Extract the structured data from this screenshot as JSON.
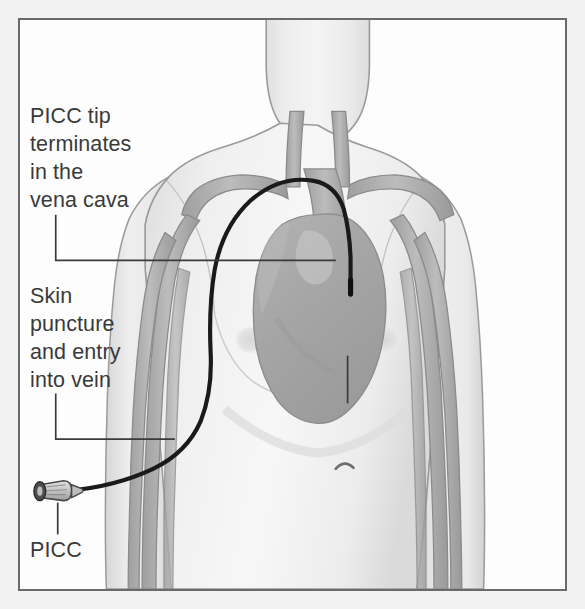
{
  "figure": {
    "type": "medical-illustration",
    "frame": {
      "border_color": "#6a6a6a",
      "background_color": "#fdfdfd",
      "outer_margin_color": "#f2f2f2"
    },
    "palette": {
      "text": "#3a3a3a",
      "leader_line": "#3a3a3a",
      "catheter": "#1a1a1a",
      "body_fill": "#ececec",
      "body_outline": "#9a9a9a",
      "vein_fill": "#b0b0b0",
      "vein_outline": "#8a8a8a",
      "heart_fill": "#a9a9a9",
      "heart_outline": "#8d8d8d",
      "hub_fill": "#c9c9c9",
      "hub_outline": "#4a4a4a"
    }
  },
  "callouts": [
    {
      "id": "picc-tip",
      "text": "PICC tip\nterminates\nin the\nvena cava",
      "leader": "elbow-right",
      "points_to": "superior vena cava"
    },
    {
      "id": "skin-puncture",
      "text": "Skin\npuncture\nand entry\ninto vein",
      "leader": "elbow-right",
      "points_to": "upper arm vein entry site"
    },
    {
      "id": "picc-device",
      "text": "PICC",
      "leader": "vertical-up",
      "points_to": "external catheter hub"
    }
  ],
  "anatomy": {
    "structures": [
      "head and neck",
      "shoulders",
      "chest and abdomen",
      "right arm",
      "left arm",
      "internal jugular veins",
      "subclavian veins",
      "superior vena cava",
      "heart",
      "basilic and cephalic arm veins",
      "navel",
      "nipples"
    ]
  },
  "device": {
    "name": "PICC",
    "full_name": "peripherally inserted central catheter",
    "parts": [
      "luer hub",
      "tapered connector",
      "catheter tubing",
      "catheter tip"
    ],
    "path": "enters a vein in the upper right arm, travels up the arm, over the shoulder through the subclavian vein, and terminates in the superior vena cava near the heart"
  }
}
